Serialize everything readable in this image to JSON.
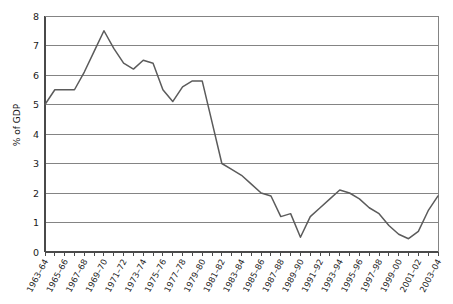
{
  "chart_data": {
    "type": "line",
    "title": "",
    "subtitle": "",
    "xlabel": "",
    "ylabel": "% of GDP",
    "ylim": [
      0,
      8
    ],
    "xlim": [
      1963,
      2003
    ],
    "ytick_labels": [
      "0",
      "1",
      "2",
      "3",
      "4",
      "5",
      "6",
      "7",
      "8"
    ],
    "ytick_values": [
      0,
      1,
      2,
      3,
      4,
      5,
      6,
      7,
      8
    ],
    "grid": "horizontal",
    "legend": "none",
    "minor_ticks": "annual",
    "label_interval": 2,
    "categories": [
      "1963-64",
      "1964-65",
      "1965-66",
      "1966-67",
      "1967-68",
      "1968-69",
      "1969-70",
      "1970-71",
      "1971-72",
      "1972-73",
      "1973-74",
      "1974-75",
      "1975-76",
      "1976-77",
      "1977-78",
      "1978-79",
      "1979-80",
      "1980-81",
      "1981-82",
      "1982-83",
      "1983-84",
      "1984-85",
      "1985-86",
      "1986-87",
      "1987-88",
      "1988-89",
      "1989-90",
      "1990-91",
      "1991-92",
      "1992-93",
      "1993-94",
      "1994-95",
      "1995-96",
      "1996-97",
      "1997-98",
      "1998-99",
      "1999-00",
      "2000-01",
      "2001-02",
      "2002-03",
      "2003-04"
    ],
    "tick_labels": [
      "1963–64",
      "1965–66",
      "1967–68",
      "1969–70",
      "1971–72",
      "1973–74",
      "1975–76",
      "1977–78",
      "1979–80",
      "1981–82",
      "1983–84",
      "1985–86",
      "1987–88",
      "1989–90",
      "1991–92",
      "1993–94",
      "1995–96",
      "1997–98",
      "1999–00",
      "2001–02",
      "2003–04"
    ],
    "series": [
      {
        "name": "% of GDP",
        "color": "#5b5b5b",
        "values": [
          5.0,
          5.5,
          5.5,
          5.5,
          6.1,
          6.8,
          7.5,
          6.9,
          6.4,
          6.2,
          6.5,
          6.4,
          5.5,
          5.1,
          5.6,
          5.8,
          5.8,
          4.4,
          3.0,
          2.8,
          2.6,
          2.3,
          2.0,
          1.9,
          1.2,
          1.3,
          0.5,
          1.2,
          1.5,
          1.8,
          2.1,
          2.0,
          1.8,
          1.5,
          1.3,
          0.9,
          0.6,
          0.45,
          0.7,
          1.4,
          1.9
        ]
      }
    ]
  }
}
